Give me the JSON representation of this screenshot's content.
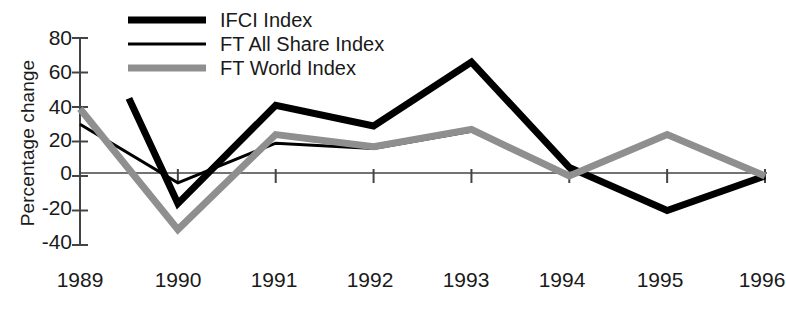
{
  "chart_data": {
    "type": "line",
    "title": "",
    "xlabel": "",
    "ylabel": "Percentage change",
    "categories": [
      "1989",
      "1990",
      "1991",
      "1992",
      "1993",
      "1994",
      "1995",
      "1996"
    ],
    "x_tick_labels": [
      "1989",
      "1990",
      "1991",
      "1992",
      "1993",
      "1994",
      "1995",
      "1996"
    ],
    "y_tick_labels": [
      "80",
      "60",
      "40",
      "20",
      "0",
      "-20",
      "-40"
    ],
    "ylim": [
      -40,
      80
    ],
    "y_step": 20,
    "grid": false,
    "legend_position": "top-left",
    "zero_line": 0,
    "series": [
      {
        "name": "IFCI Index",
        "color": "#000000",
        "width": 7,
        "note": "line begins mid-1989 behind legend",
        "start_index": 0.5,
        "categories": [
          "1989.5",
          "1990",
          "1991",
          "1992",
          "1993",
          "1994",
          "1995",
          "1996"
        ],
        "values": [
          45,
          -16,
          41,
          29,
          66,
          5,
          -20,
          0
        ]
      },
      {
        "name": "FT All Share Index",
        "color": "#000000",
        "width": 3,
        "categories": [
          "1989",
          "1990",
          "1991",
          "1992",
          "1993",
          "1994",
          "1995",
          "1996"
        ],
        "values": [
          30,
          -4,
          19,
          16,
          26,
          0,
          24,
          0
        ]
      },
      {
        "name": "FT World Index",
        "color": "#8f8f8f",
        "width": 7,
        "categories": [
          "1989",
          "1990",
          "1991",
          "1992",
          "1993",
          "1994",
          "1995",
          "1996"
        ],
        "values": [
          39,
          -31,
          24,
          17,
          27,
          0,
          24,
          0
        ]
      }
    ]
  },
  "axis": {
    "y_label": "Percentage change",
    "y_ticks": [
      "80",
      "60",
      "40",
      "20",
      "0",
      "-20",
      "-40"
    ],
    "x_ticks": [
      "1989",
      "1990",
      "1991",
      "1992",
      "1993",
      "1994",
      "1995",
      "1996"
    ]
  },
  "legend": {
    "items": [
      {
        "label": "IFCI Index",
        "style": "thick-black"
      },
      {
        "label": "FT All Share Index",
        "style": "thin-black"
      },
      {
        "label": "FT World Index",
        "style": "thick-gray"
      }
    ]
  }
}
